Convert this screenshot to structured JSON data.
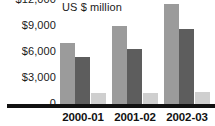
{
  "chart_data": {
    "type": "bar",
    "title": "",
    "subtitle": "",
    "unit_caption": "US $ million",
    "xlabel": "",
    "ylabel": "US $ million",
    "categories": [
      "2000-01",
      "2001-02",
      "2002-03"
    ],
    "series": [
      {
        "name": "series-1",
        "color": "#9b9b9b",
        "values": [
          7000,
          9000,
          11500
        ]
      },
      {
        "name": "series-2",
        "color": "#5d5d5d",
        "values": [
          5400,
          6400,
          8600
        ]
      },
      {
        "name": "series-3",
        "color": "#cfcfcf",
        "values": [
          1300,
          1300,
          1400
        ]
      }
    ],
    "ylim": [
      0,
      12000
    ],
    "yticks": [
      0,
      3000,
      6000,
      9000,
      12000
    ],
    "ytick_labels": [
      "0",
      "$3,000",
      "$6,000",
      "$9,000",
      "$12,000"
    ],
    "grid": false,
    "legend": "none",
    "annotations": []
  },
  "axis": {
    "y_labels": [
      {
        "text": "$12,000",
        "value": 12000
      },
      {
        "text": "$9,000",
        "value": 9000
      },
      {
        "text": "$6,000",
        "value": 6000
      },
      {
        "text": "$3,000",
        "value": 3000
      },
      {
        "text": "0",
        "value": 0
      }
    ],
    "x_labels": [
      "2000-01",
      "2001-02",
      "2002-03"
    ]
  },
  "colors": {
    "series_1": "#9b9b9b",
    "series_2": "#5d5d5d",
    "series_3": "#cfcfcf",
    "axis_line": "#111111",
    "text": "#1a1a1a",
    "background": "#ffffff"
  }
}
